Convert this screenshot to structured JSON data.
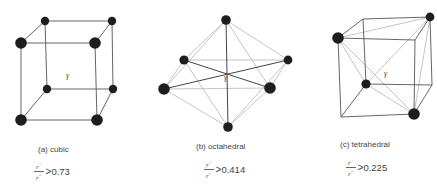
{
  "figures": [
    {
      "id": "cubic",
      "caption": "(a)  cubic",
      "center_label": "γ",
      "ratio": {
        "numerator": "r",
        "num_sup": "+",
        "denominator": "r",
        "den_sup": "−",
        "comparator": ">",
        "value": "0.73"
      }
    },
    {
      "id": "octahedral",
      "caption": "(b)  octahedral",
      "center_label": "γ",
      "ratio": {
        "numerator": "r",
        "num_sup": "+",
        "denominator": "r",
        "den_sup": "−",
        "comparator": ">",
        "value": "0.414"
      }
    },
    {
      "id": "tetrahedral",
      "caption": "(c)  tetrahedral",
      "center_label": "γ",
      "ratio": {
        "numerator": "r",
        "num_sup": "+",
        "denominator": "r",
        "den_sup": "−",
        "comparator": ">",
        "value": "0.225"
      }
    }
  ],
  "colors": {
    "atom": "#1e1e1e",
    "edge_dark": "#555555",
    "edge_light": "#bdbdbd"
  }
}
